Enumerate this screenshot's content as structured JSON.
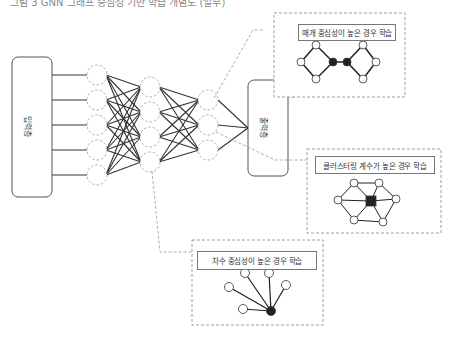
{
  "header": {
    "cut_off_text": "그림 3 GNN 그래프 중심성 기반 학습 개념도 (일부)"
  },
  "layers": {
    "input_label": "입력층",
    "output_label": "출력층"
  },
  "panels": [
    {
      "id": "betweenness",
      "title": "매개 중심성이 높은 경우 학습"
    },
    {
      "id": "clustering",
      "title": "클러스터링 계수가 높은 경우 학습"
    },
    {
      "id": "degree",
      "title": "차수 중심성이 높은 경우 학습"
    }
  ],
  "colors": {
    "line": "#333333",
    "dash": "#999999",
    "hub": "#222222",
    "node_fill": "#ffffff"
  }
}
